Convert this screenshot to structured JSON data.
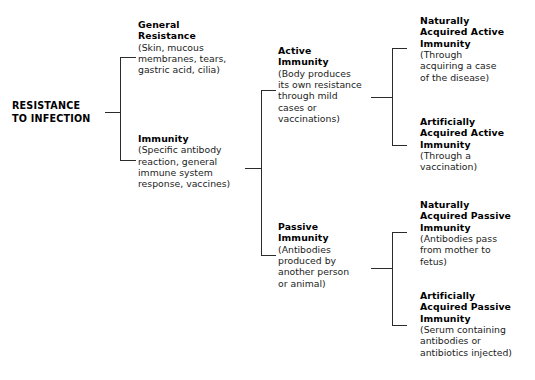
{
  "diagram": {
    "title": "Resistance to Infection",
    "type": "hierarchical-bracket-tree",
    "root": {
      "label_line1": "RESISTANCE",
      "label_line2": "TO INFECTION"
    },
    "level1": [
      {
        "heading_line1": "General",
        "heading_line2": "Resistance",
        "body_line1": "(Skin, mucous",
        "body_line2": "membranes, tears,",
        "body_line3": "gastric acid, cilia)"
      },
      {
        "heading_line1": "Immunity",
        "heading_line2": "",
        "body_line1": "(Specific antibody",
        "body_line2": "reaction, general",
        "body_line3": "immune system",
        "body_line4": "response, vaccines)"
      }
    ],
    "level2": [
      {
        "heading_line1": "Active",
        "heading_line2": "Immunity",
        "body_line1": "(Body produces",
        "body_line2": "its own resistance",
        "body_line3": "through mild",
        "body_line4": "cases or",
        "body_line5": "vaccinations)"
      },
      {
        "heading_line1": "Passive",
        "heading_line2": "Immunity",
        "body_line1": "(Antibodies",
        "body_line2": "produced by",
        "body_line3": "another person",
        "body_line4": "or animal)"
      }
    ],
    "level3": [
      {
        "heading_line1": "Naturally",
        "heading_line2": "Acquired Active",
        "heading_line3": "Immunity",
        "body_line1": "(Through",
        "body_line2": "acquiring a case",
        "body_line3": "of the disease)"
      },
      {
        "heading_line1": "Artificially",
        "heading_line2": "Acquired Active",
        "heading_line3": "Immunity",
        "body_line1": "(Through a",
        "body_line2": "vaccination)"
      },
      {
        "heading_line1": "Naturally",
        "heading_line2": "Acquired Passive",
        "heading_line3": "Immunity",
        "body_line1": "(Antibodies pass",
        "body_line2": "from mother to",
        "body_line3": "fetus)"
      },
      {
        "heading_line1": "Artificially",
        "heading_line2": "Acquired Passive",
        "heading_line3": "Immunity",
        "body_line1": "(Serum containing",
        "body_line2": "antibodies or",
        "body_line3": "antibiotics injected)"
      }
    ],
    "colors": {
      "background": "#ffffff",
      "text": "#1a1a1a",
      "heading": "#000000",
      "connector": "#2b2b2b"
    }
  }
}
